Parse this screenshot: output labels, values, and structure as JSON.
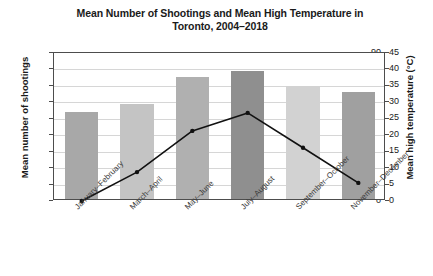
{
  "chart_data": {
    "type": "bar",
    "title": "Mean Number of Shootings and Mean High Temperature in Toronto, 2004–2018",
    "title_lines": [
      "Mean Number of Shootings and Mean High Temperature in",
      "Toronto, 2004–2018"
    ],
    "xlabel": "",
    "ylabel": "Mean number of shootings",
    "ylabel_secondary": "Mean high temperature (°C)",
    "categories": [
      "January–February",
      "March–April",
      "May–June",
      "July–August",
      "September–October",
      "November–December"
    ],
    "ylim": [
      0,
      90
    ],
    "ylim_secondary": [
      0,
      45
    ],
    "yticks": [
      0,
      10,
      20,
      30,
      40,
      50,
      60,
      70,
      80,
      90
    ],
    "yticks_secondary": [
      0,
      5,
      10,
      15,
      20,
      25,
      30,
      35,
      40,
      45
    ],
    "grid": true,
    "legend": false,
    "series": [
      {
        "name": "Mean number of shootings",
        "type": "bar",
        "axis": "left",
        "values": [
          53,
          58,
          74,
          78,
          69,
          65
        ],
        "colors": [
          "#a8a8a8",
          "#c4c4c4",
          "#b0b0b0",
          "#8f8f8f",
          "#d2d2d2",
          "#a0a0a0"
        ]
      },
      {
        "name": "Mean high temperature (°C)",
        "type": "line",
        "axis": "right",
        "values": [
          0,
          8.8,
          21.3,
          26.8,
          16.2,
          5.5
        ],
        "color": "#111111",
        "marker": "circle"
      }
    ]
  },
  "axis_ticks_left": [
    "90",
    "80",
    "70",
    "60",
    "50",
    "40",
    "30",
    "20",
    "10",
    "0"
  ],
  "axis_ticks_right": [
    "45",
    "40",
    "35",
    "30",
    "25",
    "20",
    "15",
    "10",
    "5",
    "0"
  ]
}
